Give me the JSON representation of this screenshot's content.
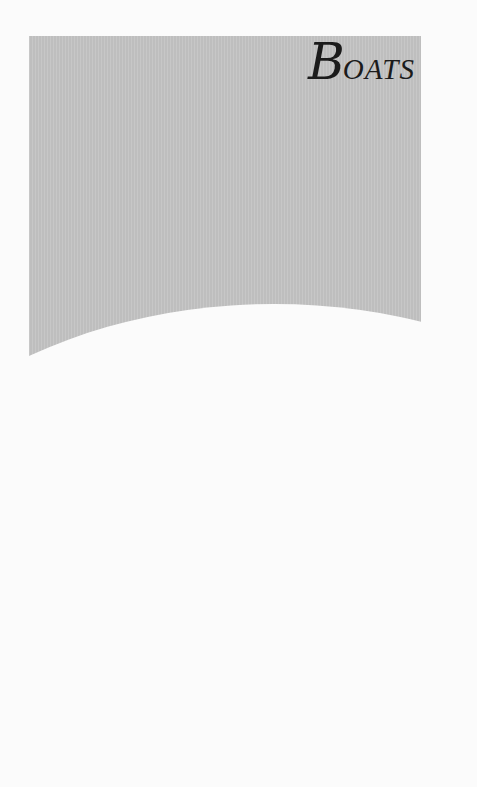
{
  "page": {
    "title_initial": "B",
    "title_rest": "OATS",
    "colors": {
      "panel": "#c4c4c4",
      "background": "#fbfbfb",
      "text": "#1b1b1b"
    }
  }
}
